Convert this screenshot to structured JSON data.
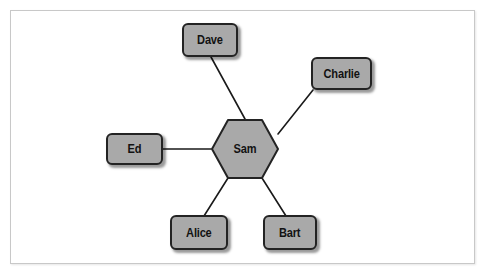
{
  "figure": {
    "type": "network-diagram",
    "layout": "hub-and-spoke",
    "background_color": "#ffffff",
    "frame_color": "#c8c8c8"
  },
  "style": {
    "node_fill": "#a9a9a9",
    "node_border": "#232323",
    "edge_color": "#1a1a1a",
    "label_color": "#121212"
  },
  "hub": {
    "id": "sam",
    "label": "Sam",
    "shape": "hexagon"
  },
  "nodes": [
    {
      "id": "dave",
      "label": "Dave",
      "shape": "rounded-rect",
      "position": "top"
    },
    {
      "id": "charlie",
      "label": "Charlie",
      "shape": "rounded-rect",
      "position": "upper-right"
    },
    {
      "id": "ed",
      "label": "Ed",
      "shape": "rounded-rect",
      "position": "left"
    },
    {
      "id": "alice",
      "label": "Alice",
      "shape": "rounded-rect",
      "position": "bottom-left"
    },
    {
      "id": "bart",
      "label": "Bart",
      "shape": "rounded-rect",
      "position": "bottom-right"
    }
  ],
  "edges": [
    {
      "from": "sam",
      "to": "dave"
    },
    {
      "from": "sam",
      "to": "charlie"
    },
    {
      "from": "sam",
      "to": "ed"
    },
    {
      "from": "sam",
      "to": "alice"
    },
    {
      "from": "sam",
      "to": "bart"
    }
  ]
}
